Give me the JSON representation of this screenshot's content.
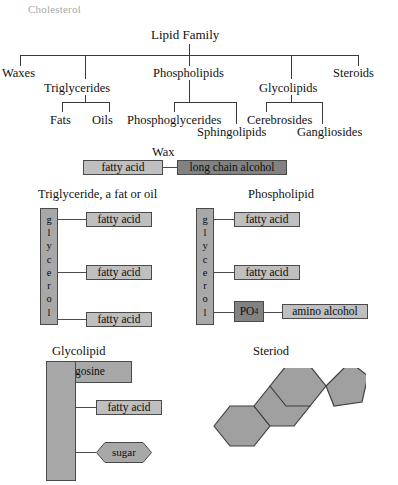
{
  "page": {
    "watermark": "Cholesterol",
    "background": "#ffffff",
    "ink": "#111111",
    "fill_light": "#bfbfbf",
    "fill_mid": "#a8a8a8",
    "fill_dark": "#828282",
    "stroke": "#4a4a4a"
  },
  "tree": {
    "root": "Lipid Family",
    "level1": [
      "Waxes",
      "Triglycerides",
      "Phospholipids",
      "Glycolipids",
      "Steroids"
    ],
    "level2": {
      "triglycerides": [
        "Fats",
        "Oils"
      ],
      "phospholipids": [
        "Phosphoglycerides",
        "Sphingolipids"
      ],
      "glycolipids": [
        "Cerebrosides",
        "Gangliosides"
      ]
    }
  },
  "wax": {
    "title": "Wax",
    "left_component": "fatty acid",
    "right_component": "long chain alcohol"
  },
  "triglyceride": {
    "title": "Triglyceride, a fat or oil",
    "backbone": "glycerol",
    "backbone_letters": [
      "g",
      "l",
      "y",
      "c",
      "e",
      "r",
      "o",
      "l"
    ],
    "chains": [
      "fatty acid",
      "fatty acid",
      "fatty acid"
    ]
  },
  "phospholipid": {
    "title": "Phospholipid",
    "backbone": "glycerol",
    "backbone_letters": [
      "g",
      "l",
      "y",
      "c",
      "e",
      "r",
      "o",
      "l"
    ],
    "chains": [
      "fatty acid",
      "fatty acid"
    ],
    "phosphate": "PO",
    "phosphate_sub": "4",
    "head_group": "amino alcohol"
  },
  "glycolipid": {
    "title": "Glycolipid",
    "backbone": "sphingosine",
    "chain": "fatty acid",
    "head_group": "sugar"
  },
  "steroid": {
    "title": "Steriod",
    "rings": [
      "hexagon",
      "hexagon",
      "hexagon",
      "pentagon"
    ]
  }
}
